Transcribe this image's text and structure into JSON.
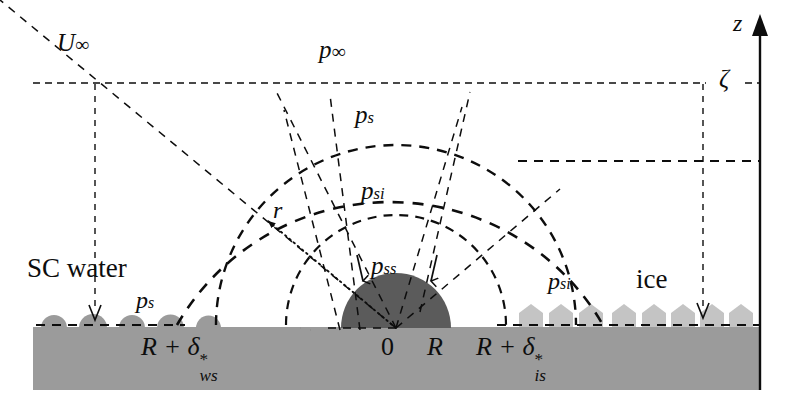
{
  "figure": {
    "colors": {
      "line": "#0d0d0d",
      "substrate": "#9b9b9b",
      "water_drop": "#9b9b9b",
      "dome": "#5b5b5b",
      "ice_crystal": "#c4c4c4",
      "background": "#ffffff"
    }
  },
  "labels": {
    "free_stream_velocity": {
      "base": "U",
      "sub": "∞"
    },
    "free_stream_pressure": {
      "base": "p",
      "sub": "∞"
    },
    "saturation_pressure_water": {
      "base": "p",
      "sub": "s"
    },
    "saturation_pressure_water_left": {
      "base": "p",
      "sub": "s"
    },
    "saturation_pressure_ice": {
      "base": "p",
      "sub": "si"
    },
    "saturation_pressure_ice_right": {
      "base": "p",
      "sub": "si"
    },
    "surface_pressure": {
      "base": "p",
      "sub": "ss"
    },
    "radial_coordinate": {
      "base": "r",
      "sub": ""
    },
    "vertical_axis": {
      "base": "z",
      "sub": ""
    },
    "boundary_layer_thickness": {
      "base": "ζ",
      "sub": ""
    },
    "sc_water_region": "SC water",
    "ice_region": "ice",
    "origin": "0",
    "dome_radius": "R",
    "water_side_extent": {
      "base": "R + δ",
      "sub": "ws",
      "sup": "*"
    },
    "ice_side_extent": {
      "base": "R + δ",
      "sub": "is",
      "sup": "*"
    }
  },
  "geometry": {
    "origin": {
      "x": 396,
      "y": 328
    },
    "dome_radius_px": 55,
    "arc_radii_px": [
      110,
      180,
      246
    ],
    "substrate": {
      "x": 33,
      "y": 327,
      "width": 727,
      "height": 63
    },
    "free_stream_line_y": 83,
    "mid_line_y": 161,
    "surface_line_y": 325,
    "z_axis_x": 760,
    "left_guide_x": 95,
    "right_guide_x": 703
  },
  "icons": {
    "z_axis_arrow": "up-arrow-icon",
    "r_vector_arrow": "radial-arrow-icon",
    "down_arrow_left": "down-arrow-icon",
    "down_arrow_right": "down-arrow-icon",
    "pss_arrow_left": "down-arrow-icon",
    "pss_arrow_right": "down-arrow-icon"
  }
}
